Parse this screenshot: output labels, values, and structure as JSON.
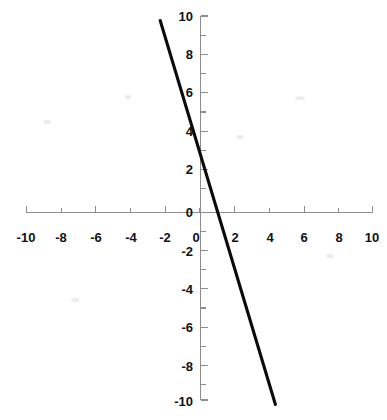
{
  "chart_data": {
    "type": "line",
    "title": "",
    "subtitle": "",
    "xlabel": "",
    "ylabel": "",
    "xlim": [
      -10,
      10
    ],
    "ylim": [
      -10,
      10
    ],
    "grid": false,
    "legend": null,
    "x_ticks": [
      -10,
      -8,
      -6,
      -4,
      -2,
      0,
      2,
      4,
      6,
      8,
      10
    ],
    "y_ticks": [
      10,
      8,
      6,
      4,
      2,
      0,
      -2,
      -4,
      -6,
      -8,
      -10
    ],
    "x_tick_labels": [
      "-10",
      "-8",
      "-6",
      "-4",
      "-2",
      "0",
      "2",
      "4",
      "6",
      "8",
      "10"
    ],
    "y_tick_labels": [
      "10",
      "8",
      "6",
      "4",
      "2",
      "0",
      "-2",
      "-4",
      "-6",
      "-8",
      "-10"
    ],
    "minor_x_ticks": [
      -9,
      -7,
      -5,
      -3,
      -1,
      1,
      3,
      5,
      7,
      9
    ],
    "minor_y_ticks": [
      9,
      7,
      5,
      3,
      1,
      -1,
      -3,
      -5,
      -7,
      -9
    ],
    "series": [
      {
        "name": "y = -3x + 3",
        "slope": -3,
        "intercept": 3,
        "x": [
          -2.33,
          4.33
        ],
        "values": [
          10,
          -10
        ],
        "x_intercept": 1,
        "y_intercept": 3,
        "color": "#0b0b0b"
      }
    ],
    "axis_color": "#8d8d8d",
    "background_color": "#ffffff",
    "annotations": []
  },
  "figure": {
    "origin_label_x": "0",
    "origin_label_y": "0",
    "width_px": 387,
    "height_px": 420
  }
}
